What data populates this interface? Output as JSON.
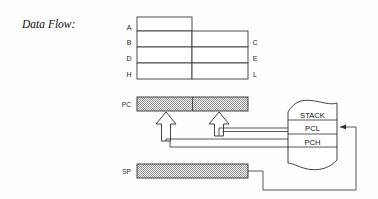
{
  "figure": {
    "title": "Data Flow:"
  },
  "registers": {
    "left_labels": [
      "A",
      "B",
      "D",
      "H"
    ],
    "right_labels": [
      "C",
      "E",
      "L"
    ],
    "rows": [
      {
        "left": "A",
        "right": "",
        "full_width": false
      },
      {
        "left": "B",
        "right": "C",
        "full_width": true
      },
      {
        "left": "D",
        "right": "E",
        "full_width": true
      },
      {
        "left": "H",
        "right": "L",
        "full_width": true
      }
    ]
  },
  "bars": [
    {
      "name": "pc",
      "label": "PC",
      "divided": true
    },
    {
      "name": "sp",
      "label": "SP",
      "divided": false
    }
  ],
  "stack": {
    "rows": [
      {
        "name": "stack-row",
        "label": "STACK"
      },
      {
        "name": "pcl-row",
        "label": "PCL"
      },
      {
        "name": "pch-row",
        "label": "PCH"
      }
    ]
  },
  "colors": {
    "background": "#fefefe",
    "ink": "#2e2e2e",
    "hatch": "#9a9a9a",
    "box_fill": "#ffffff"
  }
}
